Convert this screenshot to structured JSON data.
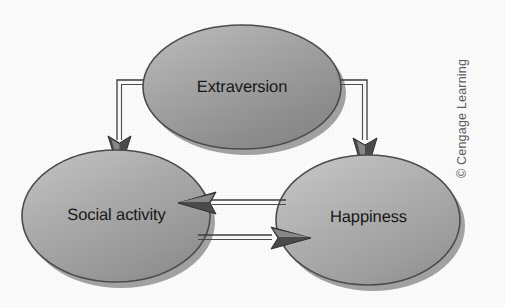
{
  "figure": {
    "type": "causal-path-diagram",
    "title": "",
    "background_color": "#fbfbfb",
    "width": 505,
    "height": 307
  },
  "nodes": [
    {
      "id": "extraversion",
      "label": "Extraversion",
      "shape": "ellipse",
      "cx": 242,
      "cy": 87,
      "rx": 99,
      "ry": 62,
      "fill": "#9b9b9b",
      "stroke": "#4b4b4b"
    },
    {
      "id": "social-activity",
      "label": "Social activity",
      "shape": "ellipse",
      "cx": 116,
      "cy": 216,
      "rx": 94,
      "ry": 66,
      "fill": "#a2a2a2",
      "stroke": "#4b4b4b"
    },
    {
      "id": "happiness",
      "label": "Happiness",
      "shape": "ellipse",
      "cx": 368,
      "cy": 220,
      "rx": 92,
      "ry": 65,
      "fill": "#a7a7a7",
      "stroke": "#4b4b4b"
    }
  ],
  "edges": [
    {
      "id": "extraversion-to-social-activity",
      "from": "extraversion",
      "to": "social-activity",
      "style": "elbow",
      "direction": "one-way",
      "arrowhead": "end"
    },
    {
      "id": "extraversion-to-happiness",
      "from": "extraversion",
      "to": "happiness",
      "style": "elbow",
      "direction": "one-way",
      "arrowhead": "end"
    },
    {
      "id": "happiness-to-social-activity",
      "from": "happiness",
      "to": "social-activity",
      "style": "straight",
      "direction": "one-way",
      "arrowhead": "end"
    },
    {
      "id": "social-activity-to-happiness",
      "from": "social-activity",
      "to": "happiness",
      "style": "straight",
      "direction": "one-way",
      "arrowhead": "end"
    }
  ],
  "attribution": {
    "text": "© Cengage Learning",
    "orientation": "rotated-90-ccw",
    "color": "#5d5d5d"
  },
  "colors": {
    "node_fill": "#9e9e9e",
    "node_stroke": "#4b4b4b",
    "arrow_stroke": "#3c3c3c",
    "arrow_fill": "#4a4a4a",
    "label_text": "#161616",
    "background": "#fbfbfb"
  }
}
